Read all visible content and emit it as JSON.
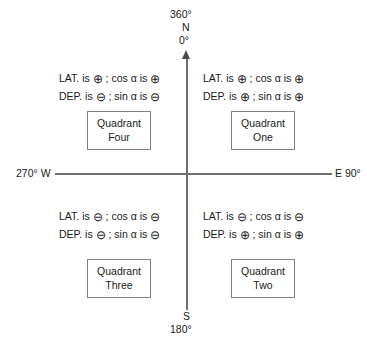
{
  "diagram": {
    "axis": {
      "north_top_bearing": "360°",
      "north_letter": "N",
      "north_zero": "0°",
      "south_letter": "S",
      "south_bearing": "180°",
      "west_label": "270°  W",
      "east_label": "E  90°",
      "line_color": "#6f6f6f"
    },
    "symbols": {
      "plus": "⊕",
      "minus": "⊖",
      "alpha": "α"
    },
    "quadrants": [
      {
        "id": "four",
        "box_line1": "Quadrant",
        "box_line2": "Four",
        "lat_prefix": "LAT. is",
        "lat_sign": "⊕",
        "cos_text": "; cos α is",
        "cos_sign": "⊕",
        "dep_prefix": "DEP. is",
        "dep_sign": "⊖",
        "sin_text": "; sin α is",
        "sin_sign": "⊖"
      },
      {
        "id": "one",
        "box_line1": "Quadrant",
        "box_line2": "One",
        "lat_prefix": "LAT. is",
        "lat_sign": "⊕",
        "cos_text": "; cos α is",
        "cos_sign": "⊕",
        "dep_prefix": "DEP. is",
        "dep_sign": "⊕",
        "sin_text": "; sin α is",
        "sin_sign": "⊕"
      },
      {
        "id": "three",
        "box_line1": "Quadrant",
        "box_line2": "Three",
        "lat_prefix": "LAT. is",
        "lat_sign": "⊖",
        "cos_text": "; cos α is",
        "cos_sign": "⊖",
        "dep_prefix": "DEP. is",
        "dep_sign": "⊖",
        "sin_text": "; sin α is",
        "sin_sign": "⊖"
      },
      {
        "id": "two",
        "box_line1": "Quadrant",
        "box_line2": "Two",
        "lat_prefix": "LAT. is",
        "lat_sign": "⊖",
        "cos_text": "; cos α is",
        "cos_sign": "⊖",
        "dep_prefix": "DEP. is",
        "dep_sign": "⊕",
        "sin_text": "; sin α is",
        "sin_sign": "⊕"
      }
    ]
  }
}
